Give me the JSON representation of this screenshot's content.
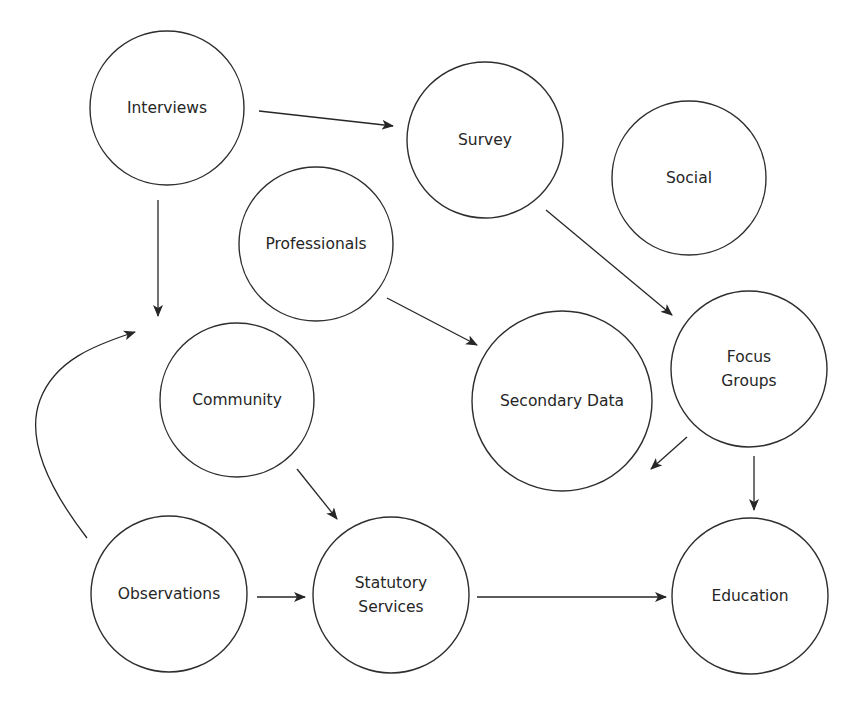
{
  "diagram": {
    "title": "",
    "stroke_color": "#2e2e2e",
    "background": "#ffffff",
    "nodes": [
      {
        "id": "interviews",
        "label": "Interviews",
        "lines": [
          "Interviews"
        ],
        "cx": 167,
        "cy": 108,
        "r": 77
      },
      {
        "id": "survey",
        "label": "Survey",
        "lines": [
          "Survey"
        ],
        "cx": 485,
        "cy": 140,
        "r": 78
      },
      {
        "id": "social",
        "label": "Social",
        "lines": [
          "Social"
        ],
        "cx": 689,
        "cy": 178,
        "r": 77
      },
      {
        "id": "professionals",
        "label": "Professionals",
        "lines": [
          "Professionals"
        ],
        "cx": 316,
        "cy": 244,
        "r": 77
      },
      {
        "id": "community",
        "label": "Community",
        "lines": [
          "Community"
        ],
        "cx": 237,
        "cy": 400,
        "r": 77
      },
      {
        "id": "secondary-data",
        "label": "Secondary Data",
        "lines": [
          "Secondary Data"
        ],
        "cx": 562,
        "cy": 401,
        "r": 90
      },
      {
        "id": "focus-groups",
        "label": "Focus Groups",
        "lines": [
          "Focus",
          "Groups"
        ],
        "cx": 749,
        "cy": 369,
        "r": 78
      },
      {
        "id": "observations",
        "label": "Observations",
        "lines": [
          "Observations"
        ],
        "cx": 169,
        "cy": 594,
        "r": 78
      },
      {
        "id": "statutory-services",
        "label": "Statutory Services",
        "lines": [
          "Statutory",
          "Services"
        ],
        "cx": 391,
        "cy": 595,
        "r": 78
      },
      {
        "id": "education",
        "label": "Education",
        "lines": [
          "Education"
        ],
        "cx": 750,
        "cy": 596,
        "r": 78
      }
    ],
    "edges": [
      {
        "from": "interviews",
        "to": "survey",
        "path": "M259,111 L393,126"
      },
      {
        "from": "interviews",
        "to": "community-area",
        "path": "M158,200 L158,316"
      },
      {
        "from": "observations",
        "to": "community-area",
        "path": "M87,538 C50,490 25,440 40,400 C55,360 95,345 135,332"
      },
      {
        "from": "professionals",
        "to": "secondary-data",
        "path": "M387,298 L477,345"
      },
      {
        "from": "survey",
        "to": "focus-groups",
        "path": "M546,210 L672,315"
      },
      {
        "from": "focus-groups",
        "to": "secondary-data",
        "path": "M687,437 L651,469"
      },
      {
        "from": "focus-groups",
        "to": "education",
        "path": "M754,456 L754,510"
      },
      {
        "from": "community",
        "to": "statutory-services",
        "path": "M297,469 L337,519"
      },
      {
        "from": "observations",
        "to": "statutory-services",
        "path": "M257,597 L305,597"
      },
      {
        "from": "statutory-services",
        "to": "education",
        "path": "M477,597 L666,597"
      }
    ]
  }
}
